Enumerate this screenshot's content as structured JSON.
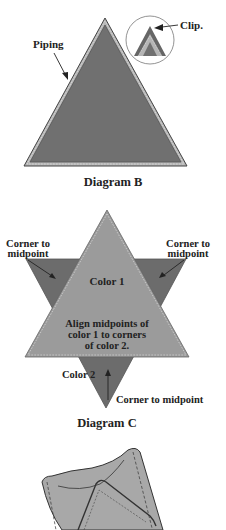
{
  "diagram_b": {
    "caption": "Diagram B",
    "label_piping": "Piping",
    "label_clip": "Clip."
  },
  "diagram_c": {
    "caption": "Diagram C",
    "label_corner_left_1": "Corner to",
    "label_corner_left_2": "midpoint",
    "label_corner_right_1": "Corner to",
    "label_corner_right_2": "midpoint",
    "label_color1": "Color 1",
    "label_align_1": "Align midpoints of",
    "label_align_2": "color 1 to corners",
    "label_align_3": "of color 2.",
    "label_color2": "Color 2",
    "label_corner_bottom": "Corner to midpoint"
  },
  "colors": {
    "dark_fabric": "#6f6f6f",
    "light_fabric": "#9a9a9a",
    "piping": "#b8b8b8",
    "outline": "#333333",
    "pocket": "#a6a6a6"
  }
}
